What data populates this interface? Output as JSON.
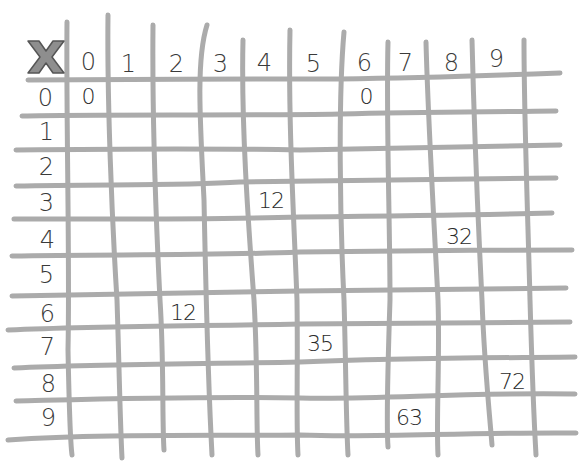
{
  "grid": {
    "corner_symbol": "X",
    "column_headers": [
      "0",
      "1",
      "2",
      "3",
      "4",
      "5",
      "6",
      "7",
      "8",
      "9"
    ],
    "row_headers": [
      "0",
      "1",
      "2",
      "3",
      "4",
      "5",
      "6",
      "7",
      "8",
      "9"
    ],
    "filled_cells": [
      {
        "row": 0,
        "col": 0,
        "value": "0"
      },
      {
        "row": 0,
        "col": 6,
        "value": "0"
      },
      {
        "row": 3,
        "col": 4,
        "value": "12"
      },
      {
        "row": 4,
        "col": 8,
        "value": "32"
      },
      {
        "row": 6,
        "col": 2,
        "value": "12"
      },
      {
        "row": 7,
        "col": 5,
        "value": "35"
      },
      {
        "row": 8,
        "col": 9,
        "value": "72"
      },
      {
        "row": 9,
        "col": 7,
        "value": "63"
      }
    ]
  },
  "cols": {
    "h0": "0",
    "h1": "1",
    "h2": "2",
    "h3": "3",
    "h4": "4",
    "h5": "5",
    "h6": "6",
    "h7": "7",
    "h8": "8",
    "h9": "9"
  },
  "rows": {
    "h0": "0",
    "h1": "1",
    "h2": "2",
    "h3": "3",
    "h4": "4",
    "h5": "5",
    "h6": "6",
    "h7": "7",
    "h8": "8",
    "h9": "9"
  },
  "cells": {
    "r0c0": "0",
    "r0c6": "0",
    "r3c4": "12",
    "r4c8": "32",
    "r6c2": "12",
    "r7c5": "35",
    "r8c9": "72",
    "r9c7": "63"
  },
  "colors": {
    "grid_line": "#9a9a9a",
    "ink": "#2a2a2a",
    "x_fill": "#8e8e8e"
  }
}
